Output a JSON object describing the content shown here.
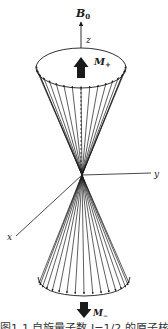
{
  "figure": {
    "labels": {
      "field": "B",
      "field_sub": "0",
      "z_axis": "z",
      "y_axis": "y",
      "x_axis": "x",
      "m_plus": "M",
      "m_plus_sub": "+",
      "m_minus": "M",
      "m_minus_sub": "−"
    },
    "colors": {
      "ink": "#1a1a1a",
      "background": "#ffffff"
    },
    "geometry": {
      "apex": [
        82,
        175
      ],
      "top_ellipse": {
        "cx": 81,
        "cy": 68,
        "rx": 45,
        "ry": 20
      },
      "bottom_ellipse": {
        "cx": 84,
        "cy": 285,
        "rx": 45,
        "ry": 11
      },
      "vector_count_per_cone": 17
    },
    "caption": "图1-1  自旋量子数 I=1/2 的原子核"
  }
}
